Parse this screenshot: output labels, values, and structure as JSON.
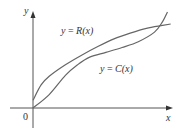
{
  "chart_data": {
    "type": "line",
    "title": "",
    "xlabel": "x",
    "ylabel": "y",
    "origin_label": "0",
    "xlim": [
      0,
      10
    ],
    "ylim": [
      0,
      10
    ],
    "grid": false,
    "ticks": false,
    "series": [
      {
        "name": "R",
        "label": "y = R(x)",
        "label_parts": {
          "lhs": "y",
          "eq": " = ",
          "fn": "R",
          "arg": "(x)"
        },
        "description": "revenue curve, concave down, starting above origin",
        "x": [
          0,
          0.5,
          1,
          2,
          3,
          4,
          5,
          6,
          7,
          8,
          8.5
        ],
        "y": [
          0.8,
          2.4,
          3.3,
          4.5,
          5.5,
          6.4,
          7.2,
          7.8,
          8.3,
          8.6,
          8.75
        ]
      },
      {
        "name": "C",
        "label": "y = C(x)",
        "label_parts": {
          "lhs": "y",
          "eq": " = ",
          "fn": "C",
          "arg": "(x)"
        },
        "description": "cost curve, S-shaped, starting at origin",
        "x": [
          0,
          1,
          2,
          2.75,
          3.5,
          4.5,
          5.5,
          6.5,
          7.5,
          8,
          8.3
        ],
        "y": [
          0,
          1.4,
          3.4,
          4.5,
          5.3,
          5.8,
          6.3,
          6.9,
          7.9,
          9.0,
          10.0
        ]
      }
    ],
    "annotations": [
      {
        "text": "intersection",
        "x": 2.75,
        "y": 4.5
      },
      {
        "text": "intersection",
        "x": 7.9,
        "y": 8.5
      }
    ]
  }
}
